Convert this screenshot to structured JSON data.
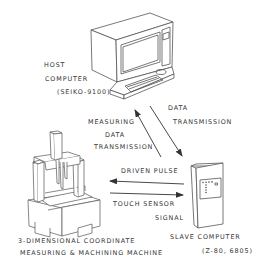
{
  "diagram": {
    "type": "system-block-diagram",
    "nodes": [
      {
        "id": "host",
        "icon": "desktop-computer-icon",
        "label_line1": "HOST",
        "label_line2": "COMPUTER",
        "label_line3": "(SEIKO-9100)"
      },
      {
        "id": "slave",
        "icon": "tower-computer-icon",
        "label_line1": "SLAVE COMPUTER",
        "label_line2": "(Z-80, 6805)"
      },
      {
        "id": "machine",
        "icon": "cmm-machine-icon",
        "label_line1": "3-DIMENSIONAL COORDINATE",
        "label_line2": "MEASURING & MACHINING MACHINE"
      }
    ],
    "edges": [
      {
        "id": "measuring-data",
        "from": "slave",
        "to": "host",
        "label_line1": "MEASURING",
        "label_line2": "DATA",
        "label_line3": "TRANSMISSION"
      },
      {
        "id": "data-transmission",
        "from": "host",
        "to": "slave",
        "label_line1": "DATA",
        "label_line2": "TRANSMISSION"
      },
      {
        "id": "driven-pulse",
        "from": "slave",
        "to": "machine",
        "label": "DRIVEN PULSE"
      },
      {
        "id": "touch-sensor",
        "from": "machine",
        "to": "slave",
        "label_line1": "TOUCH SENSOR",
        "label_line2": "SIGNAL"
      }
    ],
    "colors": {
      "line": "#555555",
      "text": "#333333",
      "background": "#ffffff"
    }
  }
}
